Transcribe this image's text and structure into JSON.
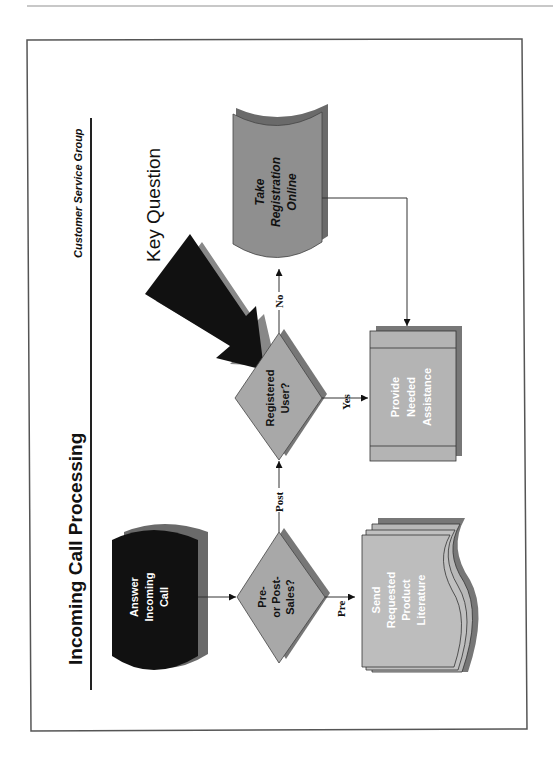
{
  "diagram": {
    "title": "Incoming Call Processing",
    "subtitle": "Customer Service Group",
    "callout": "Key Question",
    "orientation": "rotated-90-ccw",
    "nodes": [
      {
        "id": "answer",
        "shape": "display",
        "lines": [
          "Answer",
          "Incoming",
          "Call"
        ],
        "fill": "#111111",
        "text_color": "#ffffff"
      },
      {
        "id": "pre_post",
        "shape": "decision",
        "lines": [
          "Pre-",
          "or Post-",
          "Sales?"
        ],
        "fill": "#a8a8a8",
        "text_color": "#111111"
      },
      {
        "id": "registered",
        "shape": "decision",
        "lines": [
          "Registered",
          "User?"
        ],
        "fill": "#a8a8a8",
        "text_color": "#111111"
      },
      {
        "id": "take_registration",
        "shape": "stored-data",
        "lines": [
          "Take",
          "Registration",
          "Online"
        ],
        "fill": "#8f8f8f",
        "text_color": "#111111"
      },
      {
        "id": "provide_assistance",
        "shape": "predefined-process",
        "lines": [
          "Provide",
          "Needed",
          "Assistance"
        ],
        "fill": "#b4b4b4",
        "text_color": "#ffffff"
      },
      {
        "id": "send_literature",
        "shape": "multi-document",
        "lines": [
          "Send",
          "Requested",
          "Product",
          "Literature"
        ],
        "fill": "#bdbdbd",
        "text_color": "#ffffff"
      }
    ],
    "edges": [
      {
        "from": "answer",
        "to": "pre_post",
        "label": ""
      },
      {
        "from": "pre_post",
        "to": "registered",
        "label": "Post"
      },
      {
        "from": "pre_post",
        "to": "send_literature",
        "label": "Pre"
      },
      {
        "from": "registered",
        "to": "take_registration",
        "label": "No"
      },
      {
        "from": "registered",
        "to": "provide_assistance",
        "label": "Yes"
      },
      {
        "from": "take_registration",
        "to": "provide_assistance",
        "label": ""
      }
    ],
    "edge_labels": {
      "post": "Post",
      "pre": "Pre",
      "no": "No",
      "yes": "Yes"
    },
    "colors": {
      "border": "#555555",
      "shadow": "#6e6e6e",
      "arrow": "#111111"
    }
  }
}
